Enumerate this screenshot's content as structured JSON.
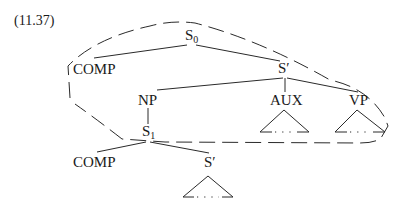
{
  "example_number": "(11.37)",
  "tree": {
    "root": {
      "label": "S",
      "subscript": "0"
    },
    "root_children": {
      "comp": "COMP",
      "s_bar": "S′"
    },
    "s_bar_children": {
      "np": "NP",
      "aux": "AUX",
      "vp": "VP"
    },
    "np_child": {
      "label": "S",
      "subscript": "1"
    },
    "s1_children": {
      "comp": "COMP",
      "s_bar": "S′"
    },
    "triangle_content": "...",
    "annotation": "dashed outline enclosing S0, COMP, S′, NP, AUX, VP and S1 node"
  }
}
